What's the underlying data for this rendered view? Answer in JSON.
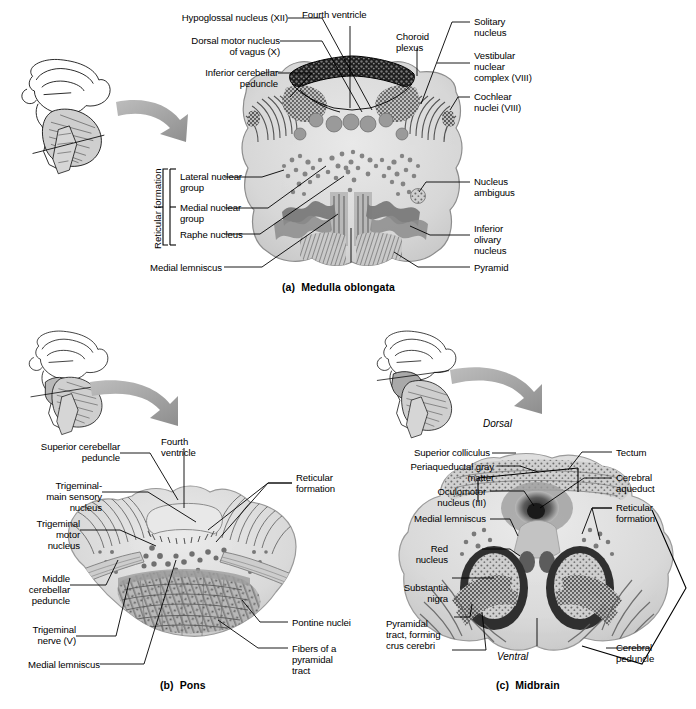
{
  "figure": {
    "panels": [
      {
        "id": "a",
        "caption": "(a)  Medulla oblongata",
        "labels_left": [
          "Hypoglossal nucleus (XII)",
          "Dorsal motor nucleus\nof vagus (X)",
          "Inferior cerebellar\npeduncle",
          "Lateral nuclear\ngroup",
          "Medial nuclear\ngroup",
          "Raphe nucleus",
          "Medial lemniscus"
        ],
        "labels_top": [
          "Fourth ventricle",
          "Choroid\nplexus"
        ],
        "labels_right": [
          "Solitary\nnucleus",
          "Vestibular\nnuclear\ncomplex (VIII)",
          "Cochlear\nnuclei (VIII)",
          "Nucleus\nambiguus",
          "Inferior\nolivary\nnucleus",
          "Pyramid"
        ],
        "bracket_label": "Reticular formation"
      },
      {
        "id": "b",
        "caption": "(b)  Pons",
        "labels_left": [
          "Superior cerebellar\npeduncle",
          "Trigeminal-\nmain sensory\nnucleus",
          "Trigeminal\nmotor\nnucleus",
          "Middle\ncerebellar\npeduncle",
          "Trigeminal\nnerve (V)",
          "Medial lemniscus"
        ],
        "labels_top": [
          "Fourth\nventricle"
        ],
        "labels_right": [
          "Reticular\nformation",
          "Pontine nuclei",
          "Fibers of a\npyramidal\ntract"
        ]
      },
      {
        "id": "c",
        "caption": "(c)  Midbrain",
        "orientation_top": "Dorsal",
        "orientation_bottom": "Ventral",
        "labels_left": [
          "Superior colliculus",
          "Periaqueductal gray\nmatter",
          "Oculomotor\nnucleus (III)",
          "Medial lemniscus",
          "Red\nnucleus",
          "Substantia\nnigra",
          "Pyramidal\ntract, forming\ncrus cerebri"
        ],
        "labels_right": [
          "Tectum",
          "Cerebral\naqueduct",
          "Reticular\nformation",
          "Cerebral\npeduncle"
        ]
      }
    ],
    "icons": {
      "inset": "brain-midsagittal-icon",
      "arrow": "curved-arrow-icon",
      "section_plane": "section-line-icon"
    },
    "colors": {
      "ink": "#000000",
      "tissue_light": "#dcdcdc",
      "tissue_mid": "#b4b4b4",
      "tissue_dark": "#6e6e6e",
      "tissue_darkest": "#2b2b2b",
      "arrow_gray": "#9a9a9a",
      "background": "#ffffff"
    }
  }
}
